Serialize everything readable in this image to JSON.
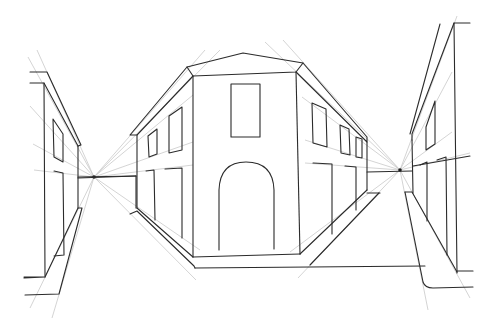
{
  "drawing": {
    "subject": "Two-point perspective street scene sketch",
    "colors": {
      "background": "#ffffff",
      "ink": "#2b2b2b",
      "guide": "#c9c9c9"
    },
    "vanishing_points": [
      {
        "name": "left",
        "x": 94,
        "y": 177
      },
      {
        "name": "right",
        "x": 400,
        "y": 170
      }
    ]
  }
}
